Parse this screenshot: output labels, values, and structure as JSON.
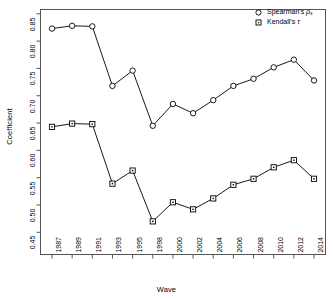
{
  "chart_data": {
    "type": "line",
    "title": "",
    "xlabel": "Wave",
    "ylabel": "Coefficient",
    "categories": [
      "1987",
      "1989",
      "1991",
      "1993",
      "1995",
      "1998",
      "2000",
      "2002",
      "2004",
      "2006",
      "2008",
      "2010",
      "2012",
      "2014"
    ],
    "xtick_labels": [
      "1987",
      "1989",
      "1991",
      "1993",
      "1995",
      "1998",
      "2000",
      "2002",
      "2004",
      "2006",
      "2008",
      "2010",
      "2012",
      "2014"
    ],
    "ytick_labels": [
      "0.85",
      "0.80",
      "0.75",
      "0.70",
      "0.65",
      "0.60",
      "0.55",
      "0.50",
      "0.45"
    ],
    "ytick_values": [
      0.85,
      0.8,
      0.75,
      0.7,
      0.65,
      0.6,
      0.55,
      0.5,
      0.45
    ],
    "ylim": [
      0.445,
      0.855
    ],
    "grid": false,
    "legend_position": "top-right",
    "series": [
      {
        "name": "Spearman's ρs",
        "marker": "circle",
        "values": [
          0.823,
          0.828,
          0.827,
          0.718,
          0.746,
          0.645,
          0.685,
          0.668,
          0.692,
          0.718,
          0.731,
          0.752,
          0.766,
          0.728
        ]
      },
      {
        "name": "Kendall's τ",
        "marker": "square",
        "values": [
          0.643,
          0.649,
          0.648,
          0.539,
          0.563,
          0.47,
          0.505,
          0.492,
          0.512,
          0.537,
          0.548,
          0.569,
          0.582,
          0.548
        ]
      }
    ]
  },
  "legend": {
    "items": [
      {
        "label_main": "Spearman's ",
        "label_sym": "ρ",
        "label_sub": "s",
        "marker": "circle"
      },
      {
        "label_main": "Kendall's ",
        "label_sym": "τ",
        "label_sub": "",
        "marker": "square"
      }
    ],
    "spearman_label": "Spearman's",
    "kendall_label": "Kendall's"
  },
  "axes": {
    "x_title": "Wave",
    "y_title": "Coefficient"
  },
  "colors": {
    "line": "#000000",
    "marker_fill": "#ffffff",
    "axis": "#555555",
    "background": "#ffffff"
  }
}
